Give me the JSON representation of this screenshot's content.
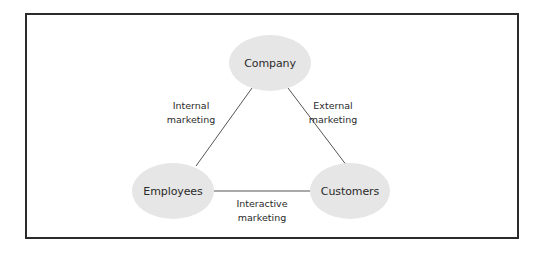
{
  "diagram": {
    "type": "triangle-relationship",
    "colors": {
      "node_fill": "#e6e6e6",
      "line": "#555555",
      "frame": "#2b2b2b",
      "text": "#2a2a2a"
    },
    "nodes": {
      "company": {
        "label": "Company"
      },
      "employees": {
        "label": "Employees"
      },
      "customers": {
        "label": "Customers"
      }
    },
    "edges": {
      "internal": {
        "from": "Company",
        "to": "Employees",
        "label_line1": "Internal",
        "label_line2": "marketing"
      },
      "external": {
        "from": "Company",
        "to": "Customers",
        "label_line1": "External",
        "label_line2": "marketing"
      },
      "interactive": {
        "from": "Employees",
        "to": "Customers",
        "label_line1": "Interactive",
        "label_line2": "marketing"
      }
    }
  }
}
